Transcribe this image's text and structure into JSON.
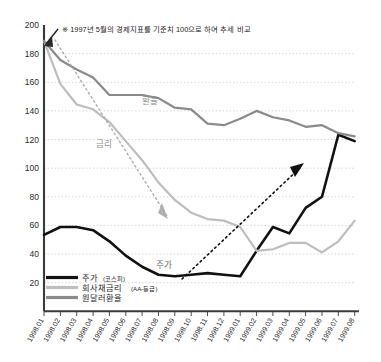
{
  "chart_data": {
    "type": "line",
    "title": "",
    "note": "※ 1997년 5월의 경제지표를 기준치 100으로 하여 추세 비교",
    "xlabel": "",
    "ylabel": "",
    "ylim": [
      20,
      200
    ],
    "ytick_step": 20,
    "yticks": [
      "200",
      "180",
      "160",
      "140",
      "120",
      "100",
      "80",
      "60",
      "40",
      "20"
    ],
    "grid": true,
    "legend_position": "bottom-left",
    "categories": [
      "1998.01",
      "1998.02",
      "1998.03",
      "1998.04",
      "1998.05",
      "1998.06",
      "1998.07",
      "1998.08",
      "1998.09",
      "1998.10",
      "1998.11",
      "1998.12",
      "1999.01",
      "1999.02",
      "1999.03",
      "1999.04",
      "1999.05",
      "1999.06",
      "1999.07",
      "1999.08"
    ],
    "series": [
      {
        "name": "주가(코스피)",
        "legend_main": "주가",
        "legend_sub": "(코스피)",
        "color": "#111111",
        "values": [
          68,
          73,
          73,
          71,
          64,
          55,
          48,
          43,
          42,
          43,
          44,
          43,
          42,
          58,
          73,
          69,
          85,
          92,
          131,
          127
        ]
      },
      {
        "name": "회사채금리(AA-등급)",
        "legend_main": "회사채금리",
        "legend_sub": "(AA-등급)",
        "color": "#bdbdbd",
        "values": [
          190,
          163,
          150,
          147,
          139,
          127,
          115,
          101,
          90,
          82,
          78,
          77,
          73,
          58,
          59,
          63,
          63,
          57,
          64,
          77
        ]
      },
      {
        "name": "원달러환율",
        "legend_main": "원달러환율",
        "legend_sub": "",
        "color": "#8a8a8a",
        "values": [
          190,
          178,
          172,
          167,
          156,
          156,
          156,
          154,
          148,
          147,
          138,
          137,
          141,
          146,
          142,
          140,
          136,
          137,
          132,
          130
        ]
      }
    ],
    "annotations": [
      {
        "name": "exchange-rate-label",
        "text": "환율",
        "x": 152,
        "y": 104
      },
      {
        "name": "interest-rate-label",
        "text": "금리",
        "x": 105,
        "y": 146
      },
      {
        "name": "stock-price-label",
        "text": "주가",
        "x": 163,
        "y": 265
      }
    ],
    "trend_arrows": [
      {
        "name": "interest-rate-down-arrow",
        "direction": "down-right",
        "style": "dotted"
      },
      {
        "name": "stock-price-up-arrow",
        "direction": "up-right",
        "style": "dotted"
      }
    ]
  }
}
